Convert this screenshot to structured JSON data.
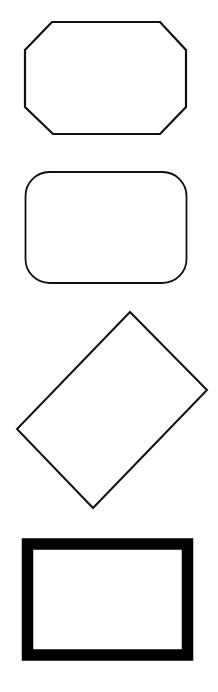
{
  "canvas": {
    "width": 218,
    "height": 692,
    "background": "#ffffff"
  },
  "shapes": [
    {
      "name": "octagon",
      "type": "polygon",
      "points": "52,22 160,22 186,50 186,107 160,134 53,134 25,107 25,50",
      "stroke": "#111111",
      "stroke_width": 2.2,
      "fill": "#ffffff"
    },
    {
      "name": "rounded-rectangle",
      "type": "rect",
      "x": 25.5,
      "y": 172,
      "width": 161,
      "height": 111,
      "rx": 24,
      "stroke": "#111111",
      "stroke_width": 1.8,
      "fill": "#ffffff"
    },
    {
      "name": "rotated-rectangle",
      "type": "polygon",
      "points": "130,312 207,390 93,508 17,429",
      "stroke": "#111111",
      "stroke_width": 2,
      "fill": "#ffffff"
    },
    {
      "name": "thick-border-rectangle",
      "type": "rect",
      "x": 27.5,
      "y": 544,
      "width": 160,
      "height": 111,
      "rx": 0,
      "stroke": "#000000",
      "stroke_width": 11.5,
      "fill": "#ffffff"
    }
  ]
}
